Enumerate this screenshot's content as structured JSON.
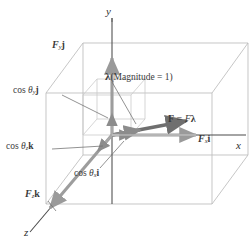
{
  "figure": {
    "background": "#ffffff",
    "colors": {
      "box_edge": "#b9b9b9",
      "inner_cube": "#c9c9c9",
      "component_arrow": "#9a9a9a",
      "resultant_arrow": "#7d7d7d",
      "unit_vector_arrow": "#8c8c8c",
      "axis": "#4a4a4a",
      "leader_line": "#6e6e6e",
      "text": "#3a3a3a"
    }
  },
  "axes": [
    {
      "id": "y-axis",
      "label": "y",
      "direction": "up"
    },
    {
      "id": "x-axis",
      "label": "x",
      "direction": "right"
    },
    {
      "id": "z-axis",
      "label": "z",
      "direction": "down-left"
    }
  ],
  "labels": {
    "y_axis": "y",
    "x_axis": "x",
    "z_axis": "z",
    "force_y": {
      "symbol": "F",
      "sub": "y",
      "unit": "j"
    },
    "force_x": {
      "symbol": "F",
      "sub": "x",
      "unit": "i"
    },
    "force_z": {
      "symbol": "F",
      "sub": "z",
      "unit": "k"
    },
    "cos_theta_y": {
      "prefix": "cos ",
      "theta": "θ",
      "sub": "y",
      "unit": "j"
    },
    "cos_theta_x": {
      "prefix": "cos ",
      "theta": "θ",
      "sub": "x",
      "unit": "i"
    },
    "cos_theta_z": {
      "prefix": "cos ",
      "theta": "θ",
      "sub": "z",
      "unit": "k"
    },
    "lambda_label": {
      "symbol": "λ",
      "text": "(Magnitude = 1)"
    },
    "resultant": {
      "bold_f": "F",
      "equals": " = ",
      "scalar_f": "F",
      "lambda": "λ"
    }
  }
}
